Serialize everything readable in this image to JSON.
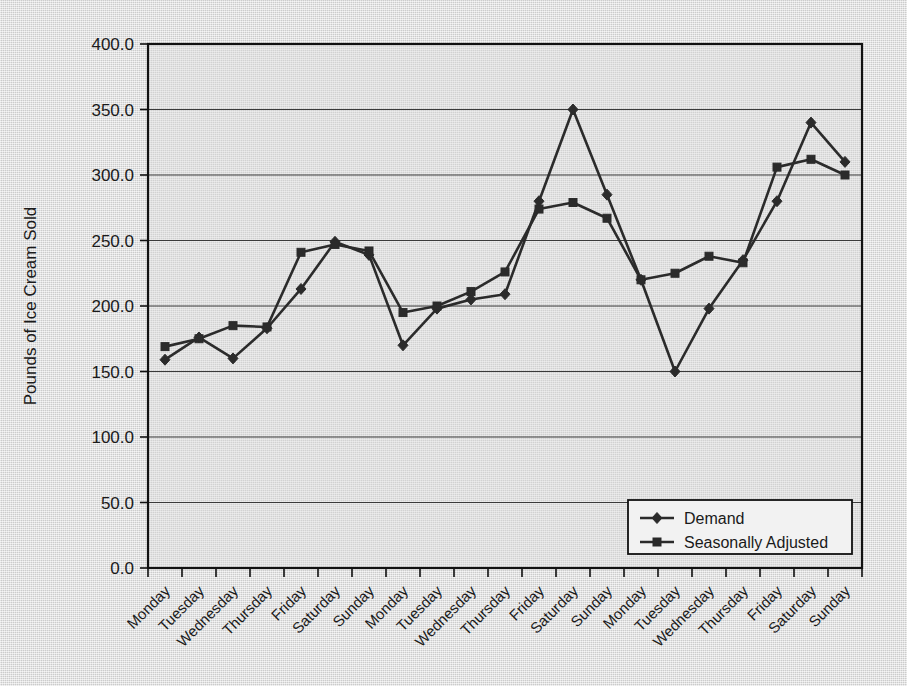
{
  "chart_data": {
    "type": "line",
    "title": "",
    "xlabel": "",
    "ylabel": "Pounds of Ice Cream Sold",
    "ylim": [
      0.0,
      400.0
    ],
    "ytick_labels": [
      "400.0",
      "350.0",
      "300.0",
      "250.0",
      "200.0",
      "150.0",
      "100.0",
      "50.0",
      "0.0"
    ],
    "ytick_values": [
      400,
      350,
      300,
      250,
      200,
      150,
      100,
      50,
      0
    ],
    "grid": "horizontal",
    "legend_position": "inside-bottom-right",
    "categories": [
      "Monday",
      "Tuesday",
      "Wednesday",
      "Thursday",
      "Friday",
      "Saturday",
      "Sunday",
      "Monday",
      "Tuesday",
      "Wednesday",
      "Thursday",
      "Friday",
      "Saturday",
      "Sunday",
      "Monday",
      "Tuesday",
      "Wednesday",
      "Thursday",
      "Friday",
      "Saturday",
      "Sunday"
    ],
    "series": [
      {
        "name": "Demand",
        "marker": "diamond",
        "color": "#2b2b2b",
        "values": [
          159,
          176,
          160,
          183,
          213,
          249,
          239,
          170,
          198,
          205,
          209,
          280,
          350,
          285,
          220,
          150,
          198,
          235,
          280,
          340,
          310
        ]
      },
      {
        "name": "Seasonally Adjusted",
        "marker": "square",
        "color": "#2b2b2b",
        "values": [
          169,
          175,
          185,
          184,
          241,
          247,
          242,
          195,
          200,
          211,
          226,
          274,
          279,
          267,
          220,
          225,
          238,
          233,
          306,
          312,
          300
        ]
      }
    ]
  },
  "legend": {
    "items": [
      {
        "label": "Demand",
        "marker": "diamond"
      },
      {
        "label": "Seasonally Adjusted",
        "marker": "square"
      }
    ]
  },
  "axis": {
    "y_title": "Pounds of Ice Cream Sold"
  }
}
